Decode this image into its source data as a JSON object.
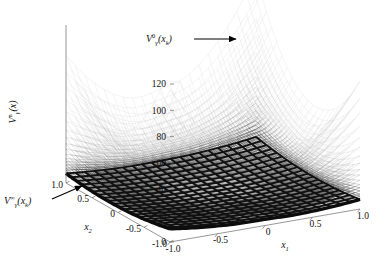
{
  "figure": {
    "title": "",
    "background_color": "#ffffff",
    "axis_color": "#555555",
    "mesh_color_top": "#c8c8c8",
    "mesh_color_mid": "#909090",
    "mesh_color_bottom": "#1a1a1a",
    "annotation_color": "#000000"
  },
  "axes": {
    "vertical": {
      "name": "V_gamma_n_of_x",
      "label_base": "V",
      "label_sub": "γ",
      "label_sup": "n",
      "label_tail": "(x)",
      "ticks": [
        "120",
        "100",
        "80",
        "60",
        "40",
        "20",
        "0"
      ],
      "range": [
        0,
        120
      ],
      "tick_step": 20
    },
    "x2": {
      "name": "x2-axis",
      "label_base": "x",
      "label_sub": "2",
      "ticks": [
        "1.0",
        "0.5",
        "0",
        "-0.5",
        "-1.0"
      ],
      "range": [
        -1.0,
        1.0
      ]
    },
    "x1": {
      "name": "x1-axis",
      "label_base": "x",
      "label_sub": "1",
      "ticks": [
        "-1.0",
        "-0.5",
        "0",
        "0.5",
        "1.0"
      ],
      "range": [
        -1.0,
        1.0
      ]
    }
  },
  "annotations": [
    {
      "id": "initial-value-function",
      "base": "V",
      "sub": "γ",
      "sup": "0",
      "tail": "(x",
      "tail_sub": "k",
      "tail_end": ")",
      "text": "Vγ⁰(xₖ)",
      "arrow": "right"
    },
    {
      "id": "converged-value-function",
      "base": "V",
      "sub": "γ",
      "sup": "∞",
      "tail": "(x",
      "tail_sub": "k",
      "tail_end": ")",
      "text": "Vγ∞(xₖ)",
      "arrow": "up-right"
    }
  ],
  "chart_data": {
    "type": "surface",
    "title": "",
    "xlabel": "x₁",
    "ylabel": "x₂",
    "zlabel": "Vγⁿ(x)",
    "xlim": [
      -1.0,
      1.0
    ],
    "ylim": [
      -1.0,
      1.0
    ],
    "zlim": [
      0,
      120
    ],
    "xticks": [
      -1.0,
      -0.5,
      0,
      0.5,
      1.0
    ],
    "yticks": [
      -1.0,
      -0.5,
      0,
      0.5,
      1.0
    ],
    "zticks": [
      0,
      20,
      40,
      60,
      80,
      100,
      120
    ],
    "grid": false,
    "legend": "none",
    "projection": "3d-wireframe-mesh",
    "series": [
      {
        "name": "V_gamma^0(x_k)",
        "iteration": 0,
        "peak_value": 120,
        "color": "#b4b4b4",
        "note": "topmost surface, annotated at top"
      },
      {
        "name": "V_gamma^1(x_k)",
        "iteration": 1,
        "peak_value": 104,
        "color": "#b8b8b8"
      },
      {
        "name": "V_gamma^2(x_k)",
        "iteration": 2,
        "peak_value": 90,
        "color": "#bbbbbb"
      },
      {
        "name": "V_gamma^3(x_k)",
        "iteration": 3,
        "peak_value": 78,
        "color": "#bdbdbd"
      },
      {
        "name": "V_gamma^4(x_k)",
        "iteration": 4,
        "peak_value": 67,
        "color": "#bfbfbf"
      },
      {
        "name": "V_gamma^5(x_k)",
        "iteration": 5,
        "peak_value": 58,
        "color": "#b0b0b0"
      },
      {
        "name": "V_gamma^6(x_k)",
        "iteration": 6,
        "peak_value": 50,
        "color": "#a6a6a6"
      },
      {
        "name": "V_gamma^7(x_k)",
        "iteration": 7,
        "peak_value": 43,
        "color": "#9c9c9c"
      },
      {
        "name": "V_gamma^8(x_k)",
        "iteration": 8,
        "peak_value": 37,
        "color": "#919191"
      },
      {
        "name": "V_gamma^9(x_k)",
        "iteration": 9,
        "peak_value": 32,
        "color": "#868686"
      },
      {
        "name": "V_gamma^10(x_k)",
        "iteration": 10,
        "peak_value": 27,
        "color": "#7a7a7a"
      },
      {
        "name": "V_gamma^11(x_k)",
        "iteration": 11,
        "peak_value": 23,
        "color": "#6e6e6e"
      },
      {
        "name": "V_gamma^12(x_k)",
        "iteration": 12,
        "peak_value": 20,
        "color": "#606060"
      },
      {
        "name": "V_gamma^13(x_k)",
        "iteration": 13,
        "peak_value": 17,
        "color": "#525252"
      },
      {
        "name": "V_gamma^14(x_k)",
        "iteration": 14,
        "peak_value": 14,
        "color": "#444444"
      },
      {
        "name": "V_gamma^15(x_k)",
        "iteration": 15,
        "peak_value": 12,
        "color": "#363636"
      },
      {
        "name": "V_gamma^inf(x_k)",
        "iteration": "inf",
        "peak_value": 9,
        "color": "#111111",
        "note": "bottom converged surface, annotated at lower left"
      }
    ]
  }
}
